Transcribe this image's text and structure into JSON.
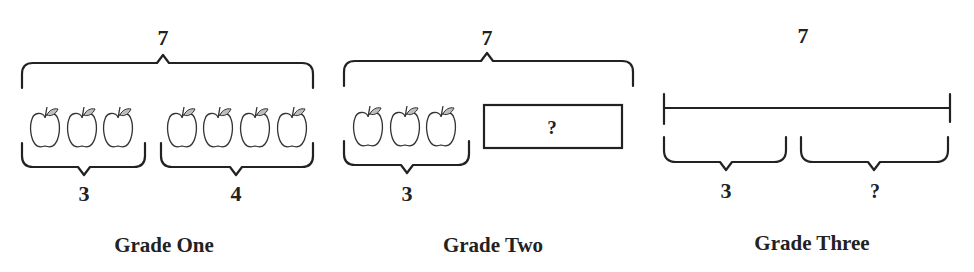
{
  "diagrams": [
    {
      "label": "Grade One",
      "total": "7",
      "parts": [
        {
          "value": "3",
          "apples": 3
        },
        {
          "value": "4",
          "apples": 4
        }
      ]
    },
    {
      "label": "Grade Two",
      "total": "7",
      "parts": [
        {
          "value": "3",
          "apples": 3
        },
        {
          "value": "?",
          "box": true
        }
      ]
    },
    {
      "label": "Grade Three",
      "total": "7",
      "parts": [
        {
          "value": "3"
        },
        {
          "value": "?"
        }
      ]
    }
  ],
  "icons": {
    "apple": "apple-icon"
  },
  "colors": {
    "ink": "#222222",
    "leaf": "#bdbdbd",
    "background": "#ffffff"
  }
}
